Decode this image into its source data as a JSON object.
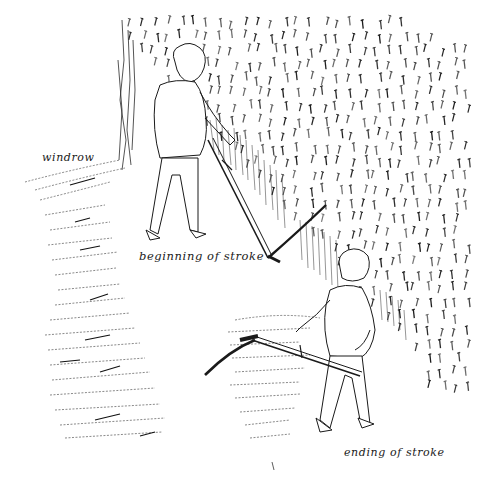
{
  "illustration": {
    "subject": "scything technique drawing",
    "background_color": "#ffffff",
    "ink_color": "#1a1a1a",
    "labels": {
      "windrow": "windrow",
      "beginning": "beginning of stroke",
      "ending": "ending of stroke"
    },
    "figures": [
      {
        "name": "mower-beginning-of-stroke",
        "position": "upper-left center"
      },
      {
        "name": "mower-ending-of-stroke",
        "position": "lower right"
      }
    ]
  }
}
